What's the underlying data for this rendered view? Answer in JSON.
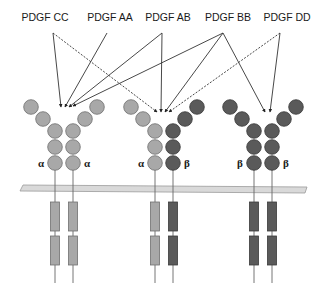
{
  "colors": {
    "alpha_fill": "#a8a8a8",
    "alpha_stroke": "#6f6f6f",
    "beta_fill": "#5a5a5a",
    "beta_stroke": "#3a3a3a",
    "membrane_fill": "#d9d9d9",
    "membrane_stroke": "#9a9a9a",
    "line": "#333333"
  },
  "ligands": [
    {
      "id": "cc",
      "label": "PDGF CC",
      "x": 45,
      "src": [
        53,
        33
      ]
    },
    {
      "id": "aa",
      "label": "PDGF AA",
      "x": 110,
      "src": [
        107,
        33
      ]
    },
    {
      "id": "ab",
      "label": "PDGF AB",
      "x": 168,
      "src": [
        162,
        33
      ]
    },
    {
      "id": "bb",
      "label": "PDGF BB",
      "x": 228,
      "src": [
        223,
        33
      ]
    },
    {
      "id": "dd",
      "label": "PDGF DD",
      "x": 287,
      "src": [
        280,
        33
      ]
    }
  ],
  "arrows": [
    {
      "from": "cc",
      "to": [
        61,
        107
      ],
      "style": "solid"
    },
    {
      "from": "cc",
      "to": [
        157,
        112
      ],
      "style": "dashed"
    },
    {
      "from": "aa",
      "to": [
        65,
        107
      ],
      "style": "solid"
    },
    {
      "from": "ab",
      "to": [
        69,
        107
      ],
      "style": "solid"
    },
    {
      "from": "ab",
      "to": [
        161,
        112
      ],
      "style": "solid"
    },
    {
      "from": "bb",
      "to": [
        73,
        106
      ],
      "style": "solid"
    },
    {
      "from": "bb",
      "to": [
        165,
        112
      ],
      "style": "solid"
    },
    {
      "from": "bb",
      "to": [
        265,
        112
      ],
      "style": "solid"
    },
    {
      "from": "dd",
      "to": [
        169,
        112
      ],
      "style": "dashed"
    },
    {
      "from": "dd",
      "to": [
        270,
        112
      ],
      "style": "solid"
    }
  ],
  "receptors": [
    {
      "id": "aa",
      "name": "PDGFR alpha-alpha",
      "left_cx": 55,
      "right_cx": 73,
      "left_type": "alpha",
      "right_type": "alpha",
      "left_label": "α",
      "right_label": "α"
    },
    {
      "id": "ab",
      "name": "PDGFR alpha-beta",
      "left_cx": 155,
      "right_cx": 173,
      "left_type": "alpha",
      "right_type": "beta",
      "left_label": "α",
      "right_label": "β"
    },
    {
      "id": "bb",
      "name": "PDGFR beta-beta",
      "left_cx": 254,
      "right_cx": 272,
      "left_type": "beta",
      "right_type": "beta",
      "left_label": "β",
      "right_label": "β"
    }
  ],
  "membrane": {
    "x1": 20,
    "x2": 307,
    "y": 186,
    "height": 6
  }
}
